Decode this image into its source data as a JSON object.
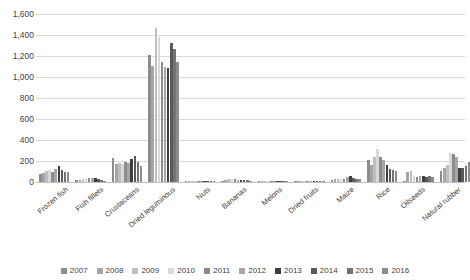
{
  "chart_data": {
    "type": "bar",
    "title": "",
    "subtitle": "",
    "xlabel": "",
    "ylabel": "",
    "ylim": [
      0,
      1600
    ],
    "ytick_values": [
      1600,
      1400,
      1200,
      1000,
      800,
      600,
      400,
      200,
      0
    ],
    "ytick_labels": [
      "1,600",
      "1,400",
      "1,200",
      "1,000",
      "800",
      "600",
      "400",
      "200",
      "0"
    ],
    "grid": true,
    "legend_position": "bottom",
    "categories": [
      "Frozen fish",
      "Fish fillets",
      "Crustaceans",
      "Dried leguminous",
      "Nuts",
      "Bananas",
      "Melons",
      "Dried fruits",
      "Maize",
      "Rice",
      "Oilseeds",
      "Natural rubber"
    ],
    "series": [
      {
        "name": "2007",
        "color": "#8c8c8c",
        "values": [
          78,
          18,
          233,
          1210,
          6,
          14,
          4,
          5,
          20,
          210,
          4,
          106
        ]
      },
      {
        "name": "2008",
        "color": "#a6a6a6",
        "values": [
          86,
          22,
          175,
          1105,
          8,
          22,
          6,
          8,
          26,
          165,
          100,
          130
        ]
      },
      {
        "name": "2009",
        "color": "#bfbfbf",
        "values": [
          104,
          30,
          178,
          1470,
          10,
          30,
          8,
          10,
          30,
          238,
          108,
          160
        ]
      },
      {
        "name": "2010",
        "color": "#d9d9d9",
        "values": [
          112,
          40,
          172,
          1380,
          9,
          26,
          7,
          9,
          24,
          310,
          56,
          272
        ]
      },
      {
        "name": "2011",
        "color": "#8c8c8c",
        "values": [
          100,
          36,
          190,
          1140,
          8,
          24,
          6,
          10,
          28,
          235,
          50,
          268
        ]
      },
      {
        "name": "2012",
        "color": "#a6a6a6",
        "values": [
          122,
          34,
          182,
          1100,
          7,
          20,
          5,
          9,
          50,
          206,
          60,
          240
        ]
      },
      {
        "name": "2013",
        "color": "#3f3f3f",
        "values": [
          150,
          42,
          218,
          1085,
          9,
          22,
          6,
          12,
          62,
          160,
          58,
          138
        ]
      },
      {
        "name": "2014",
        "color": "#595959",
        "values": [
          118,
          28,
          250,
          1325,
          8,
          18,
          5,
          14,
          36,
          128,
          52,
          132
        ]
      },
      {
        "name": "2015",
        "color": "#737373",
        "values": [
          96,
          20,
          190,
          1270,
          6,
          16,
          4,
          10,
          30,
          112,
          54,
          152
        ]
      },
      {
        "name": "2016",
        "color": "#8c8c8c",
        "values": [
          92,
          14,
          155,
          1140,
          5,
          14,
          4,
          8,
          26,
          108,
          50,
          188
        ]
      }
    ]
  }
}
